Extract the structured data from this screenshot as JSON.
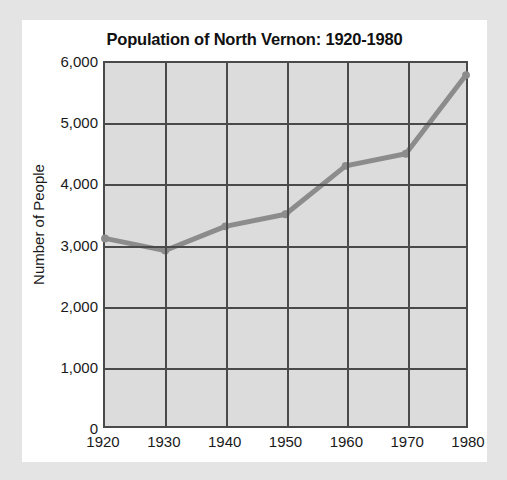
{
  "chart_data": {
    "type": "line",
    "title": "Population of North Vernon: 1920-1980",
    "xlabel": "",
    "ylabel": "Number of People",
    "categories": [
      "1920",
      "1930",
      "1940",
      "1950",
      "1960",
      "1970",
      "1980"
    ],
    "x": [
      1920,
      1930,
      1940,
      1950,
      1960,
      1970,
      1980
    ],
    "values": [
      3100,
      2900,
      3300,
      3500,
      4300,
      4500,
      5800
    ],
    "series": [
      {
        "name": "Population",
        "values": [
          3100,
          2900,
          3300,
          3500,
          4300,
          4500,
          5800
        ]
      }
    ],
    "xlim": [
      1920,
      1980
    ],
    "ylim": [
      0,
      6000
    ],
    "y_ticks": [
      0,
      1000,
      2000,
      3000,
      4000,
      5000,
      6000
    ],
    "y_tick_labels": [
      "0",
      "1,000",
      "2,000",
      "3,000",
      "4,000",
      "5,000",
      "6,000"
    ],
    "x_ticks": [
      1920,
      1930,
      1940,
      1950,
      1960,
      1970,
      1980
    ],
    "x_tick_labels": [
      "1920",
      "1930",
      "1940",
      "1950",
      "1960",
      "1970",
      "1980"
    ],
    "grid": true,
    "legend": false,
    "legend_position": "none",
    "line_color": "#8c8c8c",
    "marker_color": "#8c8c8c",
    "plot_background": "#dcdcdc",
    "axis_color": "#4a4a4a",
    "page_background": "#e4e4e4",
    "card_background": "#ffffff"
  }
}
